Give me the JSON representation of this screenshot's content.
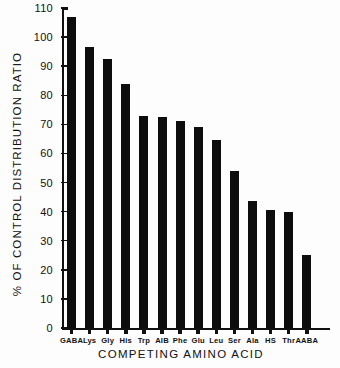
{
  "chart_data": {
    "type": "bar",
    "title": "",
    "xlabel": "COMPETING  AMINO  ACID",
    "ylabel": "%  OF  CONTROL  DISTRIBUTION  RATIO",
    "categories": [
      "GABA",
      "Lys",
      "Gly",
      "His",
      "Trp",
      "AIB",
      "Phe",
      "Glu",
      "Leu",
      "Ser",
      "Ala",
      "HS",
      "Thr",
      "AABA"
    ],
    "values": [
      107,
      96.5,
      92.5,
      84,
      73,
      72.5,
      71,
      69,
      64.5,
      54,
      43.5,
      40.5,
      40,
      25
    ],
    "ylim": [
      0,
      110
    ],
    "yticks": [
      0,
      10,
      20,
      30,
      40,
      50,
      60,
      70,
      80,
      90,
      100,
      110
    ],
    "ytick_labels": [
      "0",
      "10",
      "20",
      "30",
      "40",
      "50",
      "60",
      "70",
      "80",
      "90",
      "100",
      "110"
    ],
    "grid": false,
    "legend": null,
    "bar_color": "#0d0d0d"
  }
}
